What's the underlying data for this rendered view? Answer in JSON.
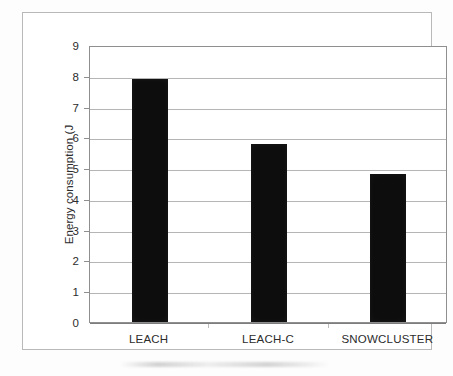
{
  "figure": {
    "background_color": "#ffffff",
    "frame_color": "#b9b9b9",
    "bar_color": "#0d0d0d",
    "gridline_color": "#b5b5b5",
    "axis_color": "#8f8f8f",
    "text_color": "#2c2c2c"
  },
  "chart_data": {
    "type": "bar",
    "title": "",
    "xlabel": "",
    "ylabel": "Energy consumption (J",
    "categories": [
      "LEACH",
      "LEACH-C",
      "SNOWCLUSTER"
    ],
    "values": [
      7.9,
      5.8,
      4.8
    ],
    "ylim": [
      0,
      9
    ],
    "ytick_step": 1,
    "yticks": [
      9,
      8,
      7,
      6,
      5,
      4,
      3,
      2,
      1,
      0
    ],
    "ytick_labels": [
      "9",
      "8",
      "7",
      "6",
      "5",
      "4",
      "3",
      "2",
      "1",
      "0"
    ],
    "grid": true,
    "grid_axis": "y",
    "legend": false,
    "legend_position": "none",
    "series": [
      {
        "name": "Energy consumption",
        "values": [
          7.9,
          5.8,
          4.8
        ],
        "color": "#0d0d0d"
      }
    ]
  }
}
